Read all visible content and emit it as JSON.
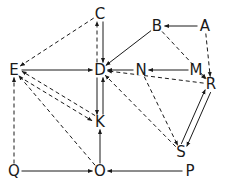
{
  "diagram": {
    "type": "directed-graph",
    "colors": {
      "stroke": "#1a1a1a",
      "background": "#ffffff"
    },
    "nodes": [
      {
        "id": "C",
        "label": "C",
        "x": 100,
        "y": 14
      },
      {
        "id": "B",
        "label": "B",
        "x": 157,
        "y": 26
      },
      {
        "id": "A",
        "label": "A",
        "x": 205,
        "y": 26
      },
      {
        "id": "E",
        "label": "E",
        "x": 14,
        "y": 70
      },
      {
        "id": "D",
        "label": "D",
        "x": 100,
        "y": 70
      },
      {
        "id": "N",
        "label": "N",
        "x": 141,
        "y": 70
      },
      {
        "id": "M",
        "label": "M",
        "x": 196,
        "y": 70
      },
      {
        "id": "R",
        "label": "R",
        "x": 211,
        "y": 84
      },
      {
        "id": "K",
        "label": "K",
        "x": 100,
        "y": 122
      },
      {
        "id": "S",
        "label": "S",
        "x": 181,
        "y": 152
      },
      {
        "id": "Q",
        "label": "Q",
        "x": 14,
        "y": 171
      },
      {
        "id": "O",
        "label": "O",
        "x": 100,
        "y": 171
      },
      {
        "id": "P",
        "label": "P",
        "x": 190,
        "y": 171
      }
    ],
    "edges": [
      {
        "from": "A",
        "to": "B",
        "style": "solid"
      },
      {
        "from": "A",
        "to": "R",
        "style": "dashed"
      },
      {
        "from": "B",
        "to": "D",
        "style": "solid"
      },
      {
        "from": "B",
        "to": "R",
        "style": "dashed"
      },
      {
        "from": "C",
        "to": "D",
        "style": "solid",
        "offset": -3
      },
      {
        "from": "D",
        "to": "C",
        "style": "dashed",
        "offset": -3
      },
      {
        "from": "C",
        "to": "E",
        "style": "dashed"
      },
      {
        "from": "E",
        "to": "D",
        "style": "solid"
      },
      {
        "from": "N",
        "to": "D",
        "style": "solid"
      },
      {
        "from": "M",
        "to": "N",
        "style": "solid"
      },
      {
        "from": "M",
        "to": "R",
        "style": "dashed"
      },
      {
        "from": "R",
        "to": "D",
        "style": "dashed"
      },
      {
        "from": "S",
        "to": "D",
        "style": "dashed"
      },
      {
        "from": "N",
        "to": "S",
        "style": "dashed"
      },
      {
        "from": "R",
        "to": "S",
        "style": "solid",
        "offset": -3
      },
      {
        "from": "S",
        "to": "R",
        "style": "solid",
        "offset": -3
      },
      {
        "from": "D",
        "to": "K",
        "style": "solid",
        "offset": 3
      },
      {
        "from": "K",
        "to": "D",
        "style": "solid",
        "offset": 3
      },
      {
        "from": "E",
        "to": "K",
        "style": "dashed",
        "offset": 3
      },
      {
        "from": "K",
        "to": "E",
        "style": "dashed",
        "offset": 3
      },
      {
        "from": "O",
        "to": "E",
        "style": "dashed"
      },
      {
        "from": "Q",
        "to": "E",
        "style": "dashed"
      },
      {
        "from": "Q",
        "to": "O",
        "style": "solid"
      },
      {
        "from": "O",
        "to": "K",
        "style": "solid"
      },
      {
        "from": "P",
        "to": "O",
        "style": "solid"
      }
    ]
  }
}
